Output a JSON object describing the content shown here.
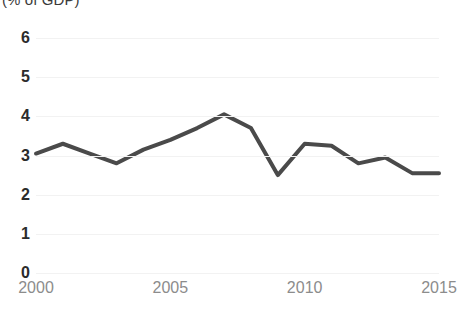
{
  "chart_data": {
    "type": "line",
    "title": "(% of GDP)",
    "xlabel": "",
    "ylabel": "",
    "x": [
      2000,
      2001,
      2002,
      2003,
      2004,
      2005,
      2006,
      2007,
      2008,
      2009,
      2010,
      2011,
      2012,
      2013,
      2014,
      2015
    ],
    "series": [
      {
        "name": "(% of GDP)",
        "color": "#4a4a4a",
        "values": [
          3.05,
          3.3,
          3.05,
          2.8,
          3.15,
          3.4,
          3.7,
          4.05,
          3.7,
          2.5,
          3.3,
          3.25,
          2.8,
          2.95,
          2.55,
          2.55
        ]
      }
    ],
    "xlim": [
      2000,
      2015
    ],
    "ylim": [
      0,
      6
    ],
    "x_tick_labels": [
      "2000",
      "2005",
      "2010",
      "2015"
    ],
    "x_tick_values": [
      2000,
      2005,
      2010,
      2015
    ],
    "y_tick_labels": [
      "0",
      "1",
      "2",
      "3",
      "4",
      "5",
      "6"
    ],
    "y_tick_values": [
      0,
      1,
      2,
      3,
      4,
      5,
      6
    ],
    "grid": {
      "horizontal": true,
      "vertical": false,
      "color": "#f2f2f2"
    },
    "legend": {
      "visible": false,
      "position": "none"
    },
    "colors": {
      "line": "#4a4a4a",
      "background": "#ffffff",
      "y_label_text": "#2b2b2b",
      "x_label_text": "#8c8c8c",
      "title_text": "#3a3a3a"
    }
  }
}
